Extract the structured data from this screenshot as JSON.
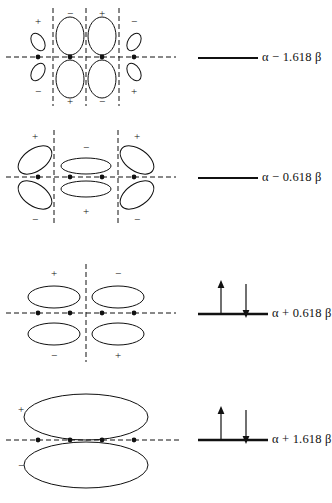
{
  "figure": {
    "atom_count": 4,
    "stroke_color": "#111111",
    "background": "#ffffff"
  },
  "levels": [
    {
      "id": "psi5",
      "energy_label": "α − 1.618 β",
      "alpha": "α",
      "operator": "−",
      "coefficient": "1.618",
      "beta": "β",
      "electrons": 0,
      "spins": [],
      "vertical_nodes": 3,
      "lobe_style": "narrow-vertical-inner-small-outer",
      "top_signs": [
        "+",
        "−",
        "+",
        "−"
      ],
      "bottom_signs": [
        "−",
        "+",
        "−",
        "+"
      ]
    },
    {
      "id": "psi4",
      "energy_label": "α − 0.618 β",
      "alpha": "α",
      "operator": "−",
      "coefficient": "0.618",
      "beta": "β",
      "electrons": 0,
      "spins": [],
      "vertical_nodes": 2,
      "lobe_style": "tilted-outer-horizontal-middle",
      "top_signs": [
        "+",
        "−",
        "+"
      ],
      "bottom_signs": [
        "−",
        "+",
        "−"
      ]
    },
    {
      "id": "psi2",
      "energy_label": "α + 0.618 β",
      "alpha": "α",
      "operator": "+",
      "coefficient": "0.618",
      "beta": "β",
      "electrons": 2,
      "spins": [
        "up",
        "down"
      ],
      "vertical_nodes": 1,
      "lobe_style": "two-horizontal-pairs",
      "top_signs": [
        "+",
        "−"
      ],
      "bottom_signs": [
        "−",
        "+"
      ]
    },
    {
      "id": "psi1",
      "energy_label": "α + 1.618 β",
      "alpha": "α",
      "operator": "+",
      "coefficient": "1.618",
      "beta": "β",
      "electrons": 2,
      "spins": [
        "up",
        "down"
      ],
      "vertical_nodes": 0,
      "lobe_style": "single-large-pair",
      "top_signs": [
        "+"
      ],
      "bottom_signs": [
        "−"
      ]
    }
  ]
}
